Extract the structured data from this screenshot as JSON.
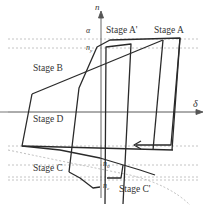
{
  "diagram": {
    "axes": {
      "vertical_label": "n",
      "horizontal_label": "δ"
    },
    "level_labels": {
      "alpha": "α",
      "n_y": "n",
      "n_y_sub": "y",
      "n_0": "n",
      "n_0_sub": "0",
      "n_c": "n",
      "n_c_sub": "c"
    },
    "stages": {
      "a_prime": "Stage A'",
      "a": "Stage A",
      "b": "Stage B",
      "c": "Stage C",
      "c_prime": "Stage C'",
      "d": "Stage D"
    },
    "colors": {
      "line": "#2a2a2a",
      "axis": "#555555",
      "dashed": "#b0b0b0",
      "gray_band": "#c8c8c8"
    }
  }
}
